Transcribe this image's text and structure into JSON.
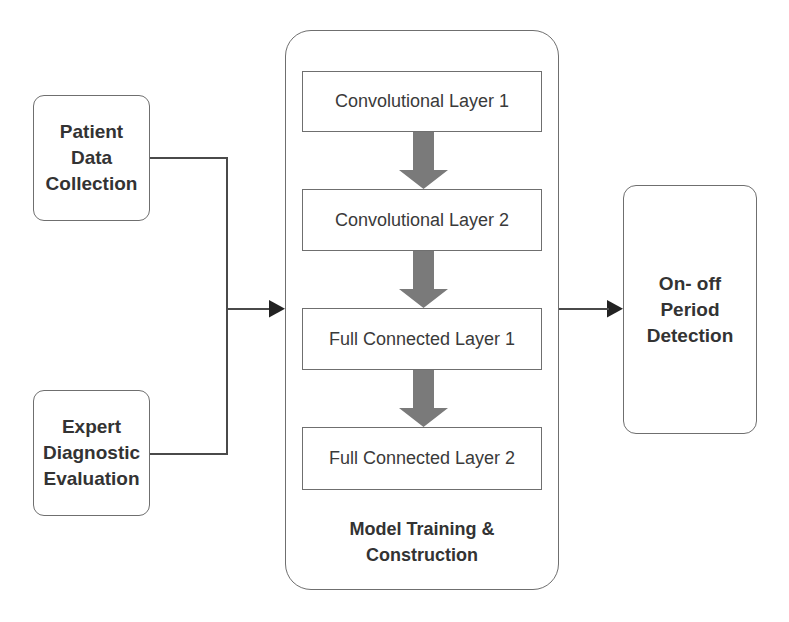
{
  "diagram": {
    "inputs": [
      {
        "label_lines": [
          "Patient",
          "Data",
          "Collection"
        ]
      },
      {
        "label_lines": [
          "Expert",
          "Diagnostic",
          "Evaluation"
        ]
      }
    ],
    "model": {
      "title_lines": [
        "Model Training &",
        "Construction"
      ],
      "layers": [
        {
          "label": "Convolutional Layer 1"
        },
        {
          "label": "Convolutional Layer 2"
        },
        {
          "label": "Full Connected Layer 1"
        },
        {
          "label": "Full Connected Layer 2"
        }
      ]
    },
    "output": {
      "label_lines": [
        "On- off",
        "Period",
        "Detection"
      ]
    },
    "colors": {
      "border": "#6f6f6f",
      "connector": "#4a4a4a",
      "layer_arrow": "#7a7a7a",
      "text": "#333333"
    }
  }
}
